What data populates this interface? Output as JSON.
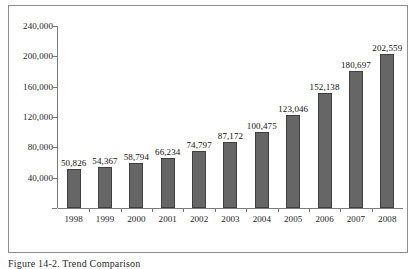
{
  "figure": {
    "caption": "Figure 14-2. Trend Comparison",
    "frame_color": "#8e8e8e"
  },
  "chart_data": {
    "type": "bar",
    "title": "",
    "subtitle": "",
    "xlabel": "",
    "ylabel": "",
    "categories": [
      "1998",
      "1999",
      "2000",
      "2001",
      "2002",
      "2003",
      "2004",
      "2005",
      "2006",
      "2007",
      "2008"
    ],
    "values": [
      50826,
      54367,
      58794,
      66234,
      74797,
      87172,
      100475,
      123046,
      152138,
      180697,
      202559
    ],
    "value_labels": [
      "50,826",
      "54,367",
      "58,794",
      "66,234",
      "74,797",
      "87,172",
      "100,475",
      "123,046",
      "152,138",
      "180,697",
      "202,559"
    ],
    "ylim": [
      0,
      240000
    ],
    "ytick_values": [
      240000,
      200000,
      160000,
      120000,
      80000,
      40000,
      0
    ],
    "ytick_labels": [
      "240,000",
      "200,000",
      "160,000",
      "120,000",
      "80,000",
      "40,000",
      ""
    ],
    "grid": false,
    "legend": null,
    "series_color": "#666666",
    "series_border_color": "#3f3f3f",
    "axis_color": "#7a7a7a",
    "data_label_position": "above-bar"
  }
}
